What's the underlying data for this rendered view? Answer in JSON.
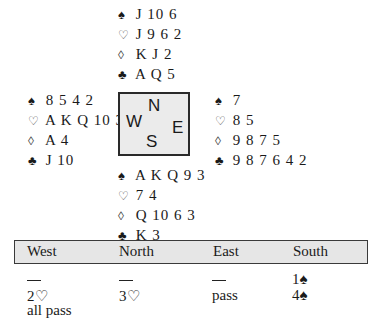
{
  "hands": {
    "north": {
      "spades": {
        "symbol": "♠",
        "cards": "J 10 6"
      },
      "hearts": {
        "symbol": "♡",
        "cards": "J 9 6 2"
      },
      "diamonds": {
        "symbol": "◊",
        "cards": "K J 2"
      },
      "clubs": {
        "symbol": "♣",
        "cards": "A Q 5"
      }
    },
    "west": {
      "spades": {
        "symbol": "♠",
        "cards": "8 5 4 2"
      },
      "hearts": {
        "symbol": "♡",
        "cards": "A K Q 10 3"
      },
      "diamonds": {
        "symbol": "◊",
        "cards": "A 4"
      },
      "clubs": {
        "symbol": "♣",
        "cards": "J 10"
      }
    },
    "east": {
      "spades": {
        "symbol": "♠",
        "cards": "7"
      },
      "hearts": {
        "symbol": "♡",
        "cards": "8 5"
      },
      "diamonds": {
        "symbol": "◊",
        "cards": "9 8 7 5"
      },
      "clubs": {
        "symbol": "♣",
        "cards": "9 8 7 6 4 2"
      }
    },
    "south": {
      "spades": {
        "symbol": "♠",
        "cards": "A K Q 9 3"
      },
      "hearts": {
        "symbol": "♡",
        "cards": "7 4"
      },
      "diamonds": {
        "symbol": "◊",
        "cards": "Q 10 6 3"
      },
      "clubs": {
        "symbol": "♣",
        "cards": "K 3"
      }
    }
  },
  "compass": {
    "n": "N",
    "w": "W",
    "e": "E",
    "s": "S"
  },
  "bidding": {
    "headers": [
      "West",
      "North",
      "East",
      "South"
    ],
    "rows": [
      [
        "—",
        "—",
        "—",
        "1♠"
      ],
      [
        "2♡",
        "3♡",
        "pass",
        "4♠"
      ],
      [
        "all pass",
        "",
        "",
        ""
      ]
    ]
  }
}
